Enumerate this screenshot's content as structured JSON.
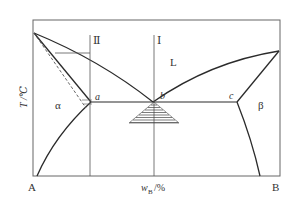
{
  "diagram": {
    "type": "binary eutectic phase diagram",
    "axis": {
      "y_label": "T /℃",
      "x_label_main": "w",
      "x_label_sub": "B",
      "x_label_unit": "/%",
      "left_component": "A",
      "right_component": "B"
    },
    "alloy_lines": [
      {
        "label": "Ⅱ"
      },
      {
        "label": "Ⅰ"
      }
    ],
    "phase_regions": {
      "liquid": "L",
      "alpha": "α",
      "beta": "β"
    },
    "points": {
      "a": "a",
      "b": "b",
      "c": "c"
    },
    "colors": {
      "line": "#2b2b2b",
      "thin_line": "#555555",
      "frame": "#666666"
    }
  }
}
